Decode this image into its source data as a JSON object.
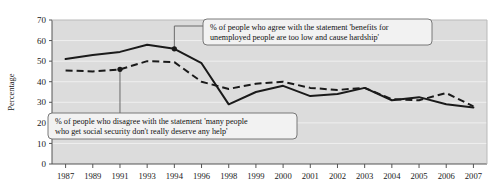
{
  "chart_data": {
    "type": "line",
    "title": "",
    "xlabel": "",
    "ylabel": "Percentage",
    "ylim": [
      0,
      70
    ],
    "ytick_step": 10,
    "yticks": [
      "0",
      "10",
      "20",
      "30",
      "40",
      "50",
      "60",
      "70"
    ],
    "grid": true,
    "legend_position": "none",
    "categories": [
      "1987",
      "1989",
      "1991",
      "1993",
      "1994",
      "1996",
      "1998",
      "1999",
      "2000",
      "2001",
      "2002",
      "2003",
      "2004",
      "2005",
      "2006",
      "2007"
    ],
    "series": [
      {
        "name": "% of people who agree with the statement 'benefits for unemployed people are too low and cause hardship'",
        "style": "solid",
        "color": "#1a1a1a",
        "values": [
          51,
          53,
          54.5,
          58,
          56,
          49,
          29,
          35,
          38,
          33,
          34,
          37,
          31,
          32.5,
          29,
          27.5
        ]
      },
      {
        "name": "% of people who disagree with the statement 'many people who get social security don't really deserve any help'",
        "style": "dashed",
        "color": "#1a1a1a",
        "values": [
          45.5,
          45,
          46,
          50,
          49.5,
          40,
          36.5,
          39,
          40,
          37,
          36,
          37,
          31.5,
          31,
          34.5,
          28
        ]
      }
    ],
    "annotations": [
      {
        "id": "agree-callout",
        "line1": "% of people who agree with the statement 'benefits for",
        "line2": "unemployed people are too low and cause hardship'",
        "anchor_category": "1994",
        "anchor_value": 56
      },
      {
        "id": "disagree-callout",
        "line1": "% of people who disagree with the statement 'many people",
        "line2": "who get social security don't really deserve any help'",
        "anchor_category": "1991",
        "anchor_value": 46
      }
    ],
    "colors": {
      "plot_background": "#dcdcdc",
      "gridline": "#efefef",
      "axis": "#555555",
      "series_line": "#1a1a1a",
      "callout_background": "#f2f2f2",
      "callout_border": "#6b6b6b"
    }
  }
}
